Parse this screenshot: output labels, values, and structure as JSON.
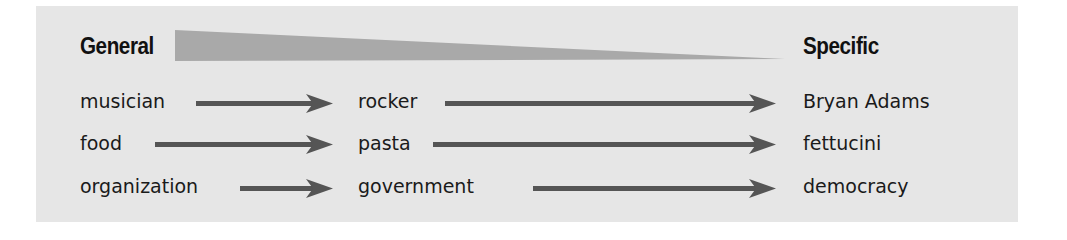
{
  "diagram": {
    "headings": {
      "left": "General",
      "right": "Specific"
    },
    "gradient_wedge": {
      "meaning": "decreasing generality",
      "color": "#a6a6a6"
    },
    "rows": [
      {
        "general": "musician",
        "intermediate": "rocker",
        "specific": "Bryan Adams"
      },
      {
        "general": "food",
        "intermediate": "pasta",
        "specific": "fettucini"
      },
      {
        "general": "organization",
        "intermediate": "government",
        "specific": "democracy"
      }
    ],
    "colors": {
      "panel_background": "#e6e6e6",
      "arrow": "#555555",
      "text": "#1a1a1a"
    }
  }
}
